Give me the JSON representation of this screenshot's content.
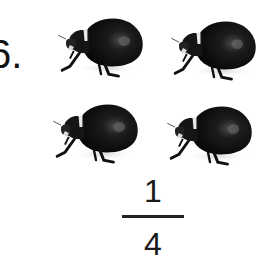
{
  "problem": {
    "number_label": "6.",
    "beetle_count": 4,
    "beetles": [
      {
        "icon": "beetle-icon",
        "x": 55,
        "y": 12
      },
      {
        "icon": "beetle-icon",
        "x": 168,
        "y": 15
      },
      {
        "icon": "beetle-icon",
        "x": 50,
        "y": 98
      },
      {
        "icon": "beetle-icon",
        "x": 164,
        "y": 100
      }
    ],
    "fraction": {
      "numerator": "1",
      "denominator": "4"
    }
  }
}
